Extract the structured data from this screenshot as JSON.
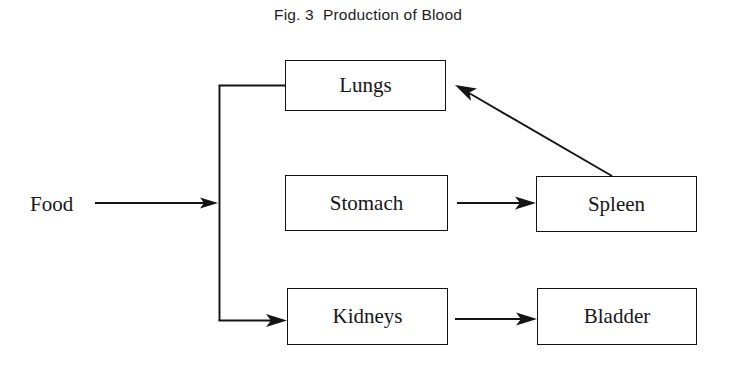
{
  "figure": {
    "title": "Fig. 3  Production of Blood",
    "background_color": "#ffffff",
    "line_color": "#141414",
    "text_color": "#161616"
  },
  "diagram": {
    "type": "flowchart",
    "nodes": [
      {
        "id": "food",
        "label": "Food",
        "shape": "text",
        "x": 30,
        "y": 192,
        "width": 0,
        "height": 0
      },
      {
        "id": "lungs",
        "label": "Lungs",
        "shape": "rectangle",
        "x": 285,
        "y": 60,
        "width": 161,
        "height": 51
      },
      {
        "id": "stomach",
        "label": "Stomach",
        "shape": "rectangle",
        "x": 285,
        "y": 175,
        "width": 163,
        "height": 56
      },
      {
        "id": "spleen",
        "label": "Spleen",
        "shape": "rectangle",
        "x": 536,
        "y": 176,
        "width": 161,
        "height": 56
      },
      {
        "id": "kidneys",
        "label": "Kidneys",
        "shape": "rectangle",
        "x": 287,
        "y": 288,
        "width": 161,
        "height": 57
      },
      {
        "id": "bladder",
        "label": "Bladder",
        "shape": "rectangle",
        "x": 537,
        "y": 288,
        "width": 160,
        "height": 57
      }
    ],
    "edges": [
      {
        "id": "food-to-junction",
        "from": "food",
        "to": "junction",
        "style": "straight",
        "arrowhead": true
      },
      {
        "id": "junction-to-lungs",
        "from": "junction",
        "to": "lungs",
        "style": "elbow",
        "arrowhead": false
      },
      {
        "id": "junction-to-stomach",
        "from": "junction",
        "to": "stomach",
        "style": "straight",
        "arrowhead": true
      },
      {
        "id": "junction-to-kidneys",
        "from": "junction",
        "to": "kidneys",
        "style": "elbow",
        "arrowhead": true
      },
      {
        "id": "stomach-to-spleen",
        "from": "stomach",
        "to": "spleen",
        "style": "straight",
        "arrowhead": true
      },
      {
        "id": "kidneys-to-bladder",
        "from": "kidneys",
        "to": "bladder",
        "style": "straight",
        "arrowhead": true
      },
      {
        "id": "spleen-to-lungs",
        "from": "spleen",
        "to": "lungs",
        "style": "diagonal",
        "arrowhead": true
      }
    ]
  }
}
